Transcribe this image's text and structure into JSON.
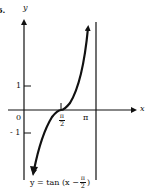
{
  "figure": {
    "problem_number": "6.",
    "axes": {
      "x_label": "x",
      "y_label": "y",
      "origin_label": "0",
      "y_ticks": [
        {
          "label": "1",
          "value": 1
        },
        {
          "label": "- 1",
          "value": -1
        }
      ],
      "x_ticks": [
        {
          "label_num": "π",
          "label_den": "2",
          "value": "π/2"
        },
        {
          "label": "π",
          "value": "π"
        }
      ]
    },
    "asymptote": {
      "x": "π",
      "style": "solid vertical line"
    },
    "curve": {
      "equation_prefix": "y = tan (x −",
      "equation_frac_num": "π",
      "equation_frac_den": "2",
      "equation_suffix": ")",
      "inflection_point": "(π/2, 0)"
    },
    "colors": {
      "ink": "#111111",
      "background": "#ffffff"
    }
  }
}
